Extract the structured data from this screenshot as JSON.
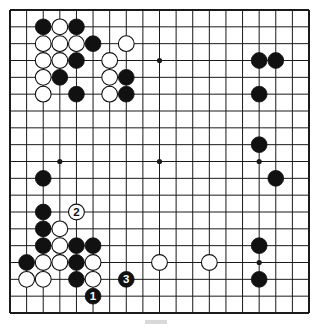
{
  "diagram": {
    "type": "go-board",
    "size": 19,
    "colors": {
      "background": "#ffffff",
      "line": "#1a1a1a",
      "black_stone": "#111111",
      "white_stone": "#ffffff"
    },
    "star_points": [
      [
        3,
        3
      ],
      [
        9,
        3
      ],
      [
        15,
        3
      ],
      [
        3,
        9
      ],
      [
        9,
        9
      ],
      [
        15,
        9
      ],
      [
        3,
        15
      ],
      [
        9,
        15
      ],
      [
        15,
        15
      ]
    ],
    "stones": [
      {
        "color": "black",
        "col": 2,
        "row": 1
      },
      {
        "color": "white",
        "col": 3,
        "row": 1
      },
      {
        "color": "black",
        "col": 4,
        "row": 1
      },
      {
        "color": "white",
        "col": 2,
        "row": 2
      },
      {
        "color": "white",
        "col": 3,
        "row": 2
      },
      {
        "color": "white",
        "col": 4,
        "row": 2
      },
      {
        "color": "black",
        "col": 5,
        "row": 2
      },
      {
        "color": "white",
        "col": 7,
        "row": 2
      },
      {
        "color": "white",
        "col": 2,
        "row": 3
      },
      {
        "color": "white",
        "col": 3,
        "row": 3
      },
      {
        "color": "black",
        "col": 4,
        "row": 3
      },
      {
        "color": "white",
        "col": 6,
        "row": 3
      },
      {
        "color": "white",
        "col": 2,
        "row": 4
      },
      {
        "color": "black",
        "col": 3,
        "row": 4
      },
      {
        "color": "white",
        "col": 6,
        "row": 4
      },
      {
        "color": "black",
        "col": 7,
        "row": 4
      },
      {
        "color": "white",
        "col": 2,
        "row": 5
      },
      {
        "color": "black",
        "col": 4,
        "row": 5
      },
      {
        "color": "white",
        "col": 6,
        "row": 5
      },
      {
        "color": "black",
        "col": 7,
        "row": 5
      },
      {
        "color": "black",
        "col": 15,
        "row": 3
      },
      {
        "color": "black",
        "col": 16,
        "row": 3
      },
      {
        "color": "black",
        "col": 15,
        "row": 5
      },
      {
        "color": "black",
        "col": 15,
        "row": 8
      },
      {
        "color": "black",
        "col": 16,
        "row": 10
      },
      {
        "color": "black",
        "col": 2,
        "row": 10
      },
      {
        "color": "black",
        "col": 2,
        "row": 12
      },
      {
        "color": "white",
        "col": 4,
        "row": 12,
        "label": "2"
      },
      {
        "color": "black",
        "col": 2,
        "row": 13
      },
      {
        "color": "white",
        "col": 3,
        "row": 13
      },
      {
        "color": "black",
        "col": 2,
        "row": 14
      },
      {
        "color": "white",
        "col": 3,
        "row": 14
      },
      {
        "color": "black",
        "col": 4,
        "row": 14
      },
      {
        "color": "black",
        "col": 5,
        "row": 14
      },
      {
        "color": "black",
        "col": 1,
        "row": 15
      },
      {
        "color": "white",
        "col": 2,
        "row": 15
      },
      {
        "color": "white",
        "col": 3,
        "row": 15
      },
      {
        "color": "black",
        "col": 4,
        "row": 15
      },
      {
        "color": "white",
        "col": 5,
        "row": 15
      },
      {
        "color": "white",
        "col": 1,
        "row": 16
      },
      {
        "color": "white",
        "col": 2,
        "row": 16
      },
      {
        "color": "black",
        "col": 4,
        "row": 16
      },
      {
        "color": "white",
        "col": 5,
        "row": 16
      },
      {
        "color": "black",
        "col": 7,
        "row": 16,
        "label": "3"
      },
      {
        "color": "black",
        "col": 5,
        "row": 17,
        "label": "1"
      },
      {
        "color": "white",
        "col": 9,
        "row": 15
      },
      {
        "color": "white",
        "col": 12,
        "row": 15
      },
      {
        "color": "black",
        "col": 15,
        "row": 14
      },
      {
        "color": "black",
        "col": 15,
        "row": 16
      }
    ],
    "move_labels": [
      "1",
      "2",
      "3"
    ]
  }
}
